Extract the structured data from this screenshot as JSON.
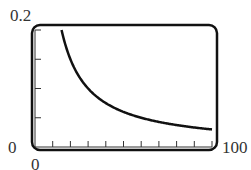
{
  "chart_data": {
    "type": "line",
    "title": "",
    "xlabel": "",
    "ylabel": "",
    "xlim": [
      0,
      100
    ],
    "ylim": [
      0,
      0.2
    ],
    "x_tick_labels": [
      "0",
      "100"
    ],
    "y_tick_labels": [
      "0",
      "0.2"
    ],
    "x_tick_step": 10,
    "y_tick_step": 0.05,
    "grid": false,
    "series": [
      {
        "name": "curve",
        "x": [
          15,
          20,
          25,
          30,
          40,
          50,
          60,
          70,
          80,
          90,
          100
        ],
        "values": [
          0.2,
          0.15,
          0.12,
          0.1,
          0.075,
          0.06,
          0.05,
          0.043,
          0.0375,
          0.033,
          0.03
        ]
      }
    ]
  },
  "labels": {
    "y_max": "0.2",
    "y_min": "0",
    "x_min": "0",
    "x_max": "100"
  }
}
